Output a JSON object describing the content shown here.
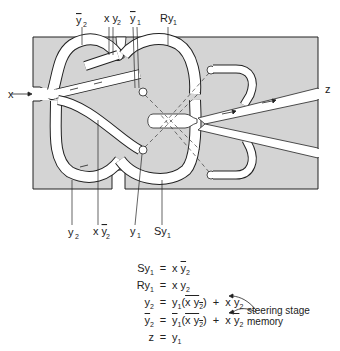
{
  "diagram": {
    "colors": {
      "substrate": "#d4d4d4",
      "channel": "#ffffff",
      "outline": "#222222"
    },
    "top_labels": [
      {
        "text": "ȳ2",
        "base": "y",
        "sub": "2",
        "overline": true
      },
      {
        "text": "x y2",
        "base": "x y",
        "sub": "2",
        "overline": false
      },
      {
        "text": "ȳ1",
        "base": "y",
        "sub": "1",
        "overline": true
      },
      {
        "text": "Ry1",
        "base": "Ry",
        "sub": "1",
        "overline": false
      }
    ],
    "bottom_labels": [
      {
        "text": "y2",
        "base": "y",
        "sub": "2",
        "overline": false
      },
      {
        "text": "x ȳ2",
        "base": "x y",
        "sub": "2",
        "overline": true
      },
      {
        "text": "y1",
        "base": "y",
        "sub": "1",
        "overline": false
      },
      {
        "text": "Sy1",
        "base": "Sy",
        "sub": "1",
        "overline": false
      }
    ],
    "input_label": "x",
    "output_label": "z"
  },
  "equations": [
    {
      "lhs": "Sy1",
      "rhs": "x ȳ2"
    },
    {
      "lhs": "Ry1",
      "rhs": "x y2"
    },
    {
      "lhs": "y2",
      "rhs": "y1(x ȳ2)‾ + x y2"
    },
    {
      "lhs": "ȳ2",
      "rhs": "ȳ1(x y2)‾ + x ȳ2"
    },
    {
      "lhs": "z",
      "rhs": "y1"
    }
  ],
  "annotation": {
    "line1": "steering stage",
    "line2": "memory"
  }
}
